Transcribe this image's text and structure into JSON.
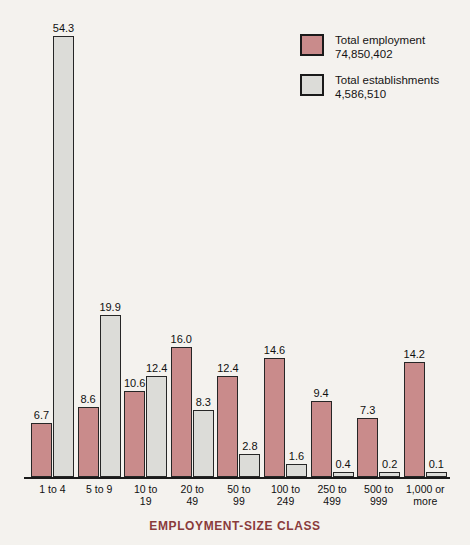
{
  "top_strip": "",
  "legend": {
    "position": "top-right",
    "items": [
      {
        "name": "Total employment",
        "value": "74,850,402",
        "color": "#c98b8b",
        "key": "employment"
      },
      {
        "name": "Total establishments",
        "value": "4,586,510",
        "color": "#dcdcd8",
        "key": "establishments"
      }
    ]
  },
  "axis": {
    "xlabel": "EMPLOYMENT-SIZE CLASS",
    "xlabel_color": "#8a3b3b"
  },
  "chart_data": {
    "type": "bar",
    "title": "",
    "xlabel": "EMPLOYMENT-SIZE CLASS",
    "ylabel": "",
    "ylim": [
      0,
      54.3
    ],
    "grid": false,
    "legend_position": "top-right",
    "units": "percent",
    "categories": [
      "1 to 4",
      "5 to 9",
      "10 to\n19",
      "20 to\n49",
      "50 to\n99",
      "100 to\n249",
      "250 to\n499",
      "500 to\n999",
      "1,000 or\nmore"
    ],
    "category_lines": [
      [
        "1 to 4"
      ],
      [
        "5 to 9"
      ],
      [
        "10 to",
        "19"
      ],
      [
        "20 to",
        "49"
      ],
      [
        "50 to",
        "99"
      ],
      [
        "100 to",
        "249"
      ],
      [
        "250 to",
        "499"
      ],
      [
        "500 to",
        "999"
      ],
      [
        "1,000 or",
        "more"
      ]
    ],
    "series": [
      {
        "name": "Total employment",
        "total": "74,850,402",
        "color": "#c98b8b",
        "values": [
          6.7,
          8.6,
          10.6,
          16.0,
          12.4,
          14.6,
          9.4,
          7.3,
          14.2
        ],
        "labels": [
          "6.7",
          "8.6",
          "10.6",
          "16.0",
          "12.4",
          "14.6",
          "9.4",
          "7.3",
          "14.2"
        ]
      },
      {
        "name": "Total establishments",
        "total": "4,586,510",
        "color": "#dcdcd8",
        "values": [
          54.3,
          19.9,
          12.4,
          8.3,
          2.8,
          1.6,
          0.4,
          0.2,
          0.1
        ],
        "labels": [
          "54.3",
          "19.9",
          "12.4",
          "8.3",
          "2.8",
          "1.6",
          "0.4",
          "0.2",
          "0.1"
        ]
      }
    ]
  }
}
